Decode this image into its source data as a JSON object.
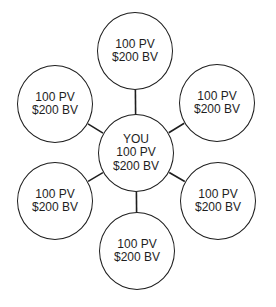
{
  "diagram": {
    "type": "hub-and-spoke",
    "colors": {
      "stroke": "#1e1e1e",
      "text": "#1e1e1e",
      "background": "#ffffff"
    },
    "center": {
      "id": "you",
      "lines": [
        "YOU",
        "100 PV",
        "$200 BV"
      ],
      "cx": 136,
      "cy": 153
    },
    "nodes": [
      {
        "id": "top",
        "lines": [
          "100 PV",
          "$200 BV"
        ],
        "cx": 135,
        "cy": 51
      },
      {
        "id": "upper-right",
        "lines": [
          "100 PV",
          "$200 BV"
        ],
        "cx": 217,
        "cy": 103
      },
      {
        "id": "lower-right",
        "lines": [
          "100 PV",
          "$200 BV"
        ],
        "cx": 218,
        "cy": 201
      },
      {
        "id": "bottom",
        "lines": [
          "100 PV",
          "$200 BV"
        ],
        "cx": 137,
        "cy": 251
      },
      {
        "id": "lower-left",
        "lines": [
          "100 PV",
          "$200 BV"
        ],
        "cx": 55,
        "cy": 201
      },
      {
        "id": "upper-left",
        "lines": [
          "100 PV",
          "$200 BV"
        ],
        "cx": 55,
        "cy": 104
      }
    ],
    "edges": [
      {
        "from": "you",
        "to": "top"
      },
      {
        "from": "you",
        "to": "upper-right"
      },
      {
        "from": "you",
        "to": "lower-right"
      },
      {
        "from": "you",
        "to": "bottom"
      },
      {
        "from": "you",
        "to": "lower-left"
      },
      {
        "from": "you",
        "to": "upper-left"
      }
    ]
  }
}
